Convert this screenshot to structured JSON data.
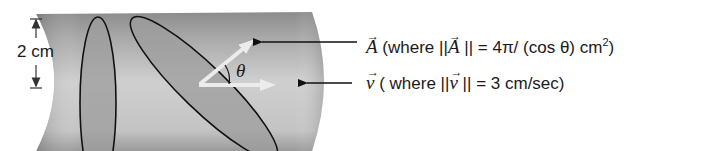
{
  "figure": {
    "dimension_label": "2 cm",
    "theta_label": "θ",
    "area_vector": {
      "symbol": "A",
      "prefix": "(where ||",
      "mid": "|| = 4π/ (cos θ) cm",
      "sup": "2",
      "suffix": ")"
    },
    "velocity_vector": {
      "symbol": "v",
      "prefix": "( where ||",
      "mid": "|| = 3 cm/sec)"
    },
    "colors": {
      "cylinder_dark": "#8a8a8a",
      "cylinder_light": "#d9d9d9",
      "ellipse_fill": "#9a9a9a",
      "outline": "#111111",
      "vector_arrow": "#ececec"
    }
  }
}
